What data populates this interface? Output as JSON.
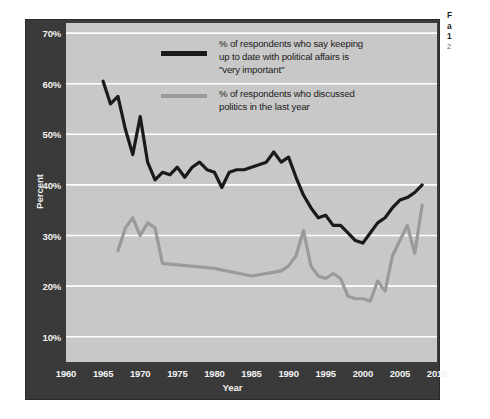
{
  "figure": {
    "background_color": "#ffffff",
    "frame_color": "#3a3a3a",
    "plot_background_color": "#c8c8c8",
    "gridline_color": "#ffffff"
  },
  "legend": {
    "position": "inside-top-center",
    "entries": [
      {
        "swatch_name": "legend-swatch-dark-line",
        "color": "#1a1a1a",
        "lines": [
          "% of respondents who say keeping",
          "up to date with political affairs is",
          "\"very important\""
        ]
      },
      {
        "swatch_name": "legend-swatch-gray-line",
        "color": "#9a9a9a",
        "lines": [
          "% of respondents who discussed",
          "politics in the last year"
        ]
      }
    ]
  },
  "side_caption": {
    "lines": [
      "F",
      "a",
      "1",
      "2"
    ]
  },
  "chart_data": {
    "type": "line",
    "title": "",
    "xlabel": "Year",
    "ylabel": "Percent",
    "xlim": [
      1960,
      2010
    ],
    "ylim": [
      5,
      72
    ],
    "grid": true,
    "xticks": [
      1960,
      1965,
      1970,
      1975,
      1980,
      1985,
      1990,
      1995,
      2000,
      2005,
      2010
    ],
    "xtick_labels": [
      "1960",
      "1965",
      "1970",
      "1975",
      "1980",
      "1985",
      "1990",
      "1995",
      "2000",
      "2005",
      "2010"
    ],
    "yticks": [
      10,
      20,
      30,
      40,
      50,
      60,
      70
    ],
    "ytick_labels": [
      "10%",
      "20%",
      "30%",
      "40%",
      "50%",
      "60%",
      "70%"
    ],
    "series": [
      {
        "name": "% of respondents who say keeping up to date with political affairs is \"very important\"",
        "color": "#1a1a1a",
        "line_width": 3.2,
        "x": [
          1965,
          1966,
          1967,
          1968,
          1969,
          1970,
          1971,
          1972,
          1973,
          1974,
          1975,
          1976,
          1977,
          1978,
          1979,
          1980,
          1981,
          1982,
          1983,
          1984,
          1985,
          1986,
          1987,
          1988,
          1989,
          1990,
          1991,
          1992,
          1993,
          1994,
          1995,
          1996,
          1997,
          1998,
          1999,
          2000,
          2001,
          2002,
          2003,
          2004,
          2005,
          2006,
          2007,
          2008
        ],
        "y": [
          60.5,
          56.0,
          57.5,
          51.0,
          46.0,
          53.5,
          44.5,
          41.0,
          42.5,
          42.0,
          43.5,
          41.5,
          43.5,
          44.5,
          43.0,
          42.5,
          39.5,
          42.5,
          43.0,
          43.0,
          43.5,
          44.0,
          44.5,
          46.5,
          44.5,
          45.5,
          41.5,
          38.0,
          35.5,
          33.5,
          34.0,
          32.0,
          32.0,
          30.5,
          29.0,
          28.5,
          30.5,
          32.5,
          33.5,
          35.5,
          37.0,
          37.5,
          38.5,
          40.0
        ]
      },
      {
        "name": "% of respondents who discussed politics in the last year",
        "color": "#9a9a9a",
        "line_width": 3.2,
        "x": [
          1967,
          1968,
          1969,
          1970,
          1971,
          1972,
          1973,
          1980,
          1985,
          1987,
          1989,
          1990,
          1991,
          1992,
          1993,
          1994,
          1995,
          1996,
          1997,
          1998,
          1999,
          2000,
          2001,
          2002,
          2003,
          2004,
          2005,
          2006,
          2007,
          2008
        ],
        "y": [
          27.0,
          31.5,
          33.5,
          30.0,
          32.5,
          31.5,
          24.5,
          23.5,
          22.0,
          22.5,
          23.0,
          24.0,
          26.0,
          31.0,
          24.0,
          22.0,
          21.5,
          22.5,
          21.5,
          18.0,
          17.5,
          17.5,
          17.0,
          21.0,
          19.0,
          26.0,
          29.0,
          32.0,
          26.5,
          36.0
        ]
      }
    ]
  }
}
